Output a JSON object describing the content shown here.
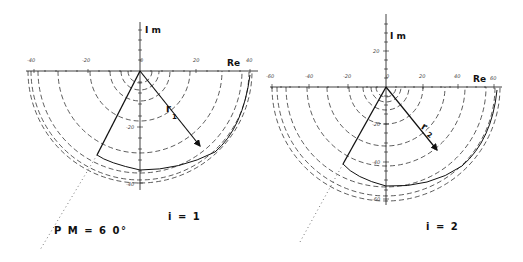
{
  "figure": {
    "annotation_pm": "P M = 6 0°",
    "plots": [
      {
        "id": "plot-1",
        "case_label": "i = 1",
        "re_label": "Re",
        "im_label": "I m",
        "radius_label": "r",
        "radius_sub": "1",
        "re_ticks": [
          {
            "label": "-40",
            "x": 34
          },
          {
            "label": "-20",
            "x": 88
          },
          {
            "label": "0",
            "x": 142
          },
          {
            "label": "20",
            "x": 196
          },
          {
            "label": "40",
            "x": 249
          }
        ],
        "im_ticks": [
          {
            "label": "-20",
            "y": 127
          },
          {
            "label": "-40",
            "y": 183
          }
        ]
      },
      {
        "id": "plot-2",
        "case_label": "i = 2",
        "re_label": "Re",
        "im_label": "I m",
        "radius_label": "r",
        "radius_sub": "2",
        "re_ticks": [
          {
            "label": "-60",
            "x": 272
          },
          {
            "label": "-40",
            "x": 309
          },
          {
            "label": "-20",
            "x": 348
          },
          {
            "label": "0",
            "x": 387
          },
          {
            "label": "20",
            "x": 423
          },
          {
            "label": "40",
            "x": 458
          },
          {
            "label": "60",
            "x": 494
          }
        ],
        "im_ticks": [
          {
            "label": "20",
            "y": 51
          },
          {
            "label": "-20",
            "y": 124
          },
          {
            "label": "-40",
            "y": 162
          },
          {
            "label": "-60",
            "y": 199
          }
        ]
      }
    ]
  }
}
